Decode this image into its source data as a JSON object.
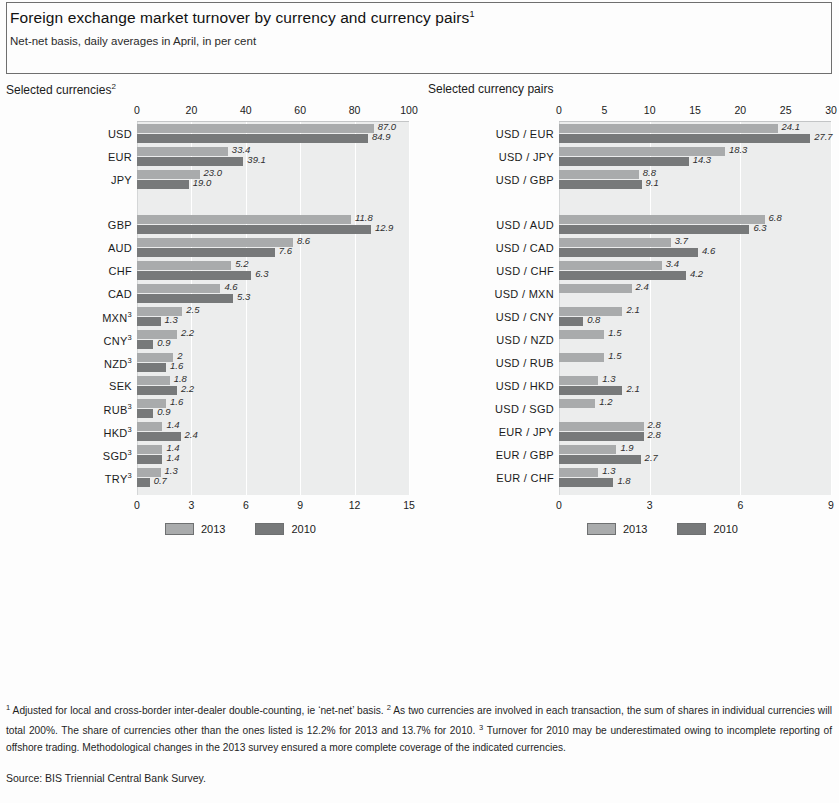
{
  "header": {
    "title": "Foreign exchange market turnover by currency and currency pairs",
    "title_sup": "1",
    "subtitle": "Net-net basis, daily averages in April, in per cent"
  },
  "legend": {
    "items": [
      {
        "label": "2013",
        "color": "#a9abac"
      },
      {
        "label": "2010",
        "color": "#77797a"
      }
    ]
  },
  "footnotes": {
    "text_1_sup": "1",
    "text_1": " Adjusted for local and cross-border inter-dealer double-counting, ie ‘net-net’ basis. ",
    "text_2_sup": "2",
    "text_2": " As two currencies are involved in each transaction, the sum of shares in individual currencies will total 200%. The share of currencies other than the ones listed is 12.2% for 2013 and 13.7% for 2010. ",
    "text_3_sup": "3",
    "text_3": " Turnover for 2010 may be underestimated owing to incomplete reporting of offshore trading. Methodological changes in the 2013 survey ensured a more complete coverage of the indicated currencies.",
    "source": "Source: BIS Triennial Central Bank Survey."
  },
  "chart_data": [
    {
      "type": "bar",
      "orientation": "horizontal",
      "panel_title": "Selected currencies",
      "panel_title_sup": "2",
      "title": "Foreign exchange market turnover by currency",
      "xlabel": "per cent",
      "ylabel": "",
      "grid": true,
      "legend_position": "bottom",
      "series": [
        {
          "name": "2013",
          "color": "#a9abac"
        },
        {
          "name": "2010",
          "color": "#77797a"
        }
      ],
      "top_axis": {
        "ticks": [
          0,
          20,
          40,
          60,
          80,
          100
        ],
        "xlim": [
          0,
          100
        ]
      },
      "bottom_axis": {
        "ticks": [
          0,
          3,
          6,
          9,
          12,
          15
        ],
        "xlim": [
          0,
          15
        ]
      },
      "groups": [
        {
          "scale": "top",
          "rows": [
            {
              "category": "USD",
              "sup": "",
              "values": {
                "2013": 87.0,
                "2010": 84.9
              },
              "labels": {
                "2013": "87.0",
                "2010": "84.9"
              }
            },
            {
              "category": "EUR",
              "sup": "",
              "values": {
                "2013": 33.4,
                "2010": 39.1
              },
              "labels": {
                "2013": "33.4",
                "2010": "39.1"
              }
            },
            {
              "category": "JPY",
              "sup": "",
              "values": {
                "2013": 23.0,
                "2010": 19.0
              },
              "labels": {
                "2013": "23.0",
                "2010": "19.0"
              }
            }
          ]
        },
        {
          "scale": "bottom",
          "rows": [
            {
              "category": "GBP",
              "sup": "",
              "values": {
                "2013": 11.8,
                "2010": 12.9
              },
              "labels": {
                "2013": "11.8",
                "2010": "12.9"
              }
            },
            {
              "category": "AUD",
              "sup": "",
              "values": {
                "2013": 8.6,
                "2010": 7.6
              },
              "labels": {
                "2013": "8.6",
                "2010": "7.6"
              }
            },
            {
              "category": "CHF",
              "sup": "",
              "values": {
                "2013": 5.2,
                "2010": 6.3
              },
              "labels": {
                "2013": "5.2",
                "2010": "6.3"
              }
            },
            {
              "category": "CAD",
              "sup": "",
              "values": {
                "2013": 4.6,
                "2010": 5.3
              },
              "labels": {
                "2013": "4.6",
                "2010": "5.3"
              }
            },
            {
              "category": "MXN",
              "sup": "3",
              "values": {
                "2013": 2.5,
                "2010": 1.3
              },
              "labels": {
                "2013": "2.5",
                "2010": "1.3"
              }
            },
            {
              "category": "CNY",
              "sup": "3",
              "values": {
                "2013": 2.2,
                "2010": 0.9
              },
              "labels": {
                "2013": "2.2",
                "2010": "0.9"
              }
            },
            {
              "category": "NZD",
              "sup": "3",
              "values": {
                "2013": 2.0,
                "2010": 1.6
              },
              "labels": {
                "2013": "2",
                "2010": "1.6"
              }
            },
            {
              "category": "SEK",
              "sup": "",
              "values": {
                "2013": 1.8,
                "2010": 2.2
              },
              "labels": {
                "2013": "1.8",
                "2010": "2.2"
              }
            },
            {
              "category": "RUB",
              "sup": "3",
              "values": {
                "2013": 1.6,
                "2010": 0.9
              },
              "labels": {
                "2013": "1.6",
                "2010": "0.9"
              }
            },
            {
              "category": "HKD",
              "sup": "3",
              "values": {
                "2013": 1.4,
                "2010": 2.4
              },
              "labels": {
                "2013": "1.4",
                "2010": "2.4"
              }
            },
            {
              "category": "SGD",
              "sup": "3",
              "values": {
                "2013": 1.4,
                "2010": 1.4
              },
              "labels": {
                "2013": "1.4",
                "2010": "1.4"
              }
            },
            {
              "category": "TRY",
              "sup": "3",
              "values": {
                "2013": 1.3,
                "2010": 0.7
              },
              "labels": {
                "2013": "1.3",
                "2010": "0.7"
              }
            }
          ]
        }
      ]
    },
    {
      "type": "bar",
      "orientation": "horizontal",
      "panel_title": "Selected currency pairs",
      "panel_title_sup": "",
      "title": "Foreign exchange market turnover by currency pairs",
      "xlabel": "per cent",
      "ylabel": "",
      "grid": true,
      "legend_position": "bottom",
      "series": [
        {
          "name": "2013",
          "color": "#a9abac"
        },
        {
          "name": "2010",
          "color": "#77797a"
        }
      ],
      "top_axis": {
        "ticks": [
          0,
          5,
          10,
          15,
          20,
          25,
          30
        ],
        "xlim": [
          0,
          30
        ]
      },
      "bottom_axis": {
        "ticks": [
          0,
          3,
          6,
          9
        ],
        "xlim": [
          0,
          9
        ]
      },
      "groups": [
        {
          "scale": "top",
          "rows": [
            {
              "category": "USD / EUR",
              "sup": "",
              "values": {
                "2013": 24.1,
                "2010": 27.7
              },
              "labels": {
                "2013": "24.1",
                "2010": "27.7"
              }
            },
            {
              "category": "USD / JPY",
              "sup": "",
              "values": {
                "2013": 18.3,
                "2010": 14.3
              },
              "labels": {
                "2013": "18.3",
                "2010": "14.3"
              }
            },
            {
              "category": "USD / GBP",
              "sup": "",
              "values": {
                "2013": 8.8,
                "2010": 9.1
              },
              "labels": {
                "2013": "8.8",
                "2010": "9.1"
              }
            }
          ]
        },
        {
          "scale": "bottom",
          "rows": [
            {
              "category": "USD / AUD",
              "sup": "",
              "values": {
                "2013": 6.8,
                "2010": 6.3
              },
              "labels": {
                "2013": "6.8",
                "2010": "6.3"
              }
            },
            {
              "category": "USD / CAD",
              "sup": "",
              "values": {
                "2013": 3.7,
                "2010": 4.6
              },
              "labels": {
                "2013": "3.7",
                "2010": "4.6"
              }
            },
            {
              "category": "USD / CHF",
              "sup": "",
              "values": {
                "2013": 3.4,
                "2010": 4.2
              },
              "labels": {
                "2013": "3.4",
                "2010": "4.2"
              }
            },
            {
              "category": "USD / MXN",
              "sup": "",
              "values": {
                "2013": 2.4,
                "2010": null
              },
              "labels": {
                "2013": "2.4",
                "2010": ""
              }
            },
            {
              "category": "USD / CNY",
              "sup": "",
              "values": {
                "2013": 2.1,
                "2010": 0.8
              },
              "labels": {
                "2013": "2.1",
                "2010": "0.8"
              }
            },
            {
              "category": "USD / NZD",
              "sup": "",
              "values": {
                "2013": 1.5,
                "2010": null
              },
              "labels": {
                "2013": "1.5",
                "2010": ""
              }
            },
            {
              "category": "USD / RUB",
              "sup": "",
              "values": {
                "2013": 1.5,
                "2010": null
              },
              "labels": {
                "2013": "1.5",
                "2010": ""
              }
            },
            {
              "category": "USD / HKD",
              "sup": "",
              "values": {
                "2013": 1.3,
                "2010": 2.1
              },
              "labels": {
                "2013": "1.3",
                "2010": "2.1"
              }
            },
            {
              "category": "USD / SGD",
              "sup": "",
              "values": {
                "2013": 1.2,
                "2010": null
              },
              "labels": {
                "2013": "1.2",
                "2010": ""
              }
            },
            {
              "category": "EUR / JPY",
              "sup": "",
              "values": {
                "2013": 2.8,
                "2010": 2.8
              },
              "labels": {
                "2013": "2.8",
                "2010": "2.8"
              }
            },
            {
              "category": "EUR / GBP",
              "sup": "",
              "values": {
                "2013": 1.9,
                "2010": 2.7
              },
              "labels": {
                "2013": "1.9",
                "2010": "2.7"
              }
            },
            {
              "category": "EUR / CHF",
              "sup": "",
              "values": {
                "2013": 1.3,
                "2010": 1.8
              },
              "labels": {
                "2013": "1.3",
                "2010": "1.8"
              }
            }
          ]
        }
      ]
    }
  ]
}
